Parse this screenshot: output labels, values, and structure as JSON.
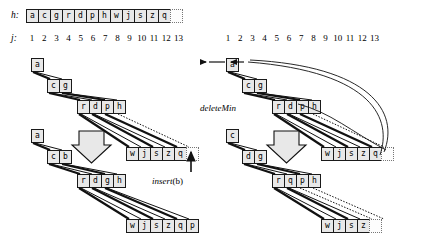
{
  "figure": {
    "labels": {
      "h": "h:",
      "j": "j:",
      "insert": "insert",
      "insert_arg": "(b)",
      "deletemin": "deleteMin"
    },
    "colors": {
      "cell_fill": "#e8e8e8",
      "cell_stroke": "#1a1a1a",
      "ghost_stroke": "#777777",
      "edge": "#111111",
      "arrow_fill": "#e8e8e8",
      "background": "#ffffff"
    }
  },
  "array": {
    "name": "h:",
    "cells": [
      "a",
      "c",
      "g",
      "r",
      "d",
      "p",
      "h",
      "w",
      "j",
      "s",
      "z",
      "q"
    ],
    "trailing_empty": 1
  },
  "indices": {
    "name": "j:",
    "values": [
      "1",
      "2",
      "3",
      "4",
      "5",
      "6",
      "7",
      "8",
      "9",
      "10",
      "11",
      "12",
      "13"
    ]
  },
  "left_panel": {
    "caption": "insert",
    "caption_arg": "(b)",
    "before": {
      "levels": [
        {
          "cells": [
            "a"
          ]
        },
        {
          "cells": [
            "c",
            "g"
          ]
        },
        {
          "cells": [
            "r",
            "d",
            "p",
            "h"
          ]
        },
        {
          "cells": [
            "w",
            "j",
            "s",
            "z",
            "q"
          ],
          "ghost": 1
        }
      ]
    },
    "after": {
      "levels": [
        {
          "cells": [
            "a"
          ]
        },
        {
          "cells": [
            "c",
            "b"
          ]
        },
        {
          "cells": [
            "r",
            "d",
            "g",
            "h"
          ]
        },
        {
          "cells": [
            "w",
            "j",
            "s",
            "z",
            "q",
            "p"
          ]
        }
      ]
    }
  },
  "right_panel": {
    "caption": "deleteMin",
    "before": {
      "levels": [
        {
          "cells": [
            "a"
          ]
        },
        {
          "cells": [
            "c",
            "g"
          ]
        },
        {
          "cells": [
            "r",
            "d",
            "p",
            "h"
          ]
        },
        {
          "cells": [
            "w",
            "j",
            "s",
            "z",
            "q"
          ],
          "ghost": 1
        }
      ]
    },
    "after": {
      "levels": [
        {
          "cells": [
            "c"
          ]
        },
        {
          "cells": [
            "d",
            "g"
          ]
        },
        {
          "cells": [
            "r",
            "q",
            "p",
            "h"
          ]
        },
        {
          "cells": [
            "w",
            "j",
            "s",
            "z"
          ],
          "ghost": 1
        }
      ]
    }
  }
}
